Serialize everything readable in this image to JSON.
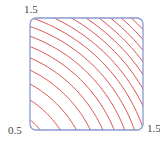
{
  "chart_data": {
    "type": "line",
    "subtype": "contour",
    "title": "",
    "xlabel": "",
    "ylabel": "",
    "xlim": [
      0.5,
      1.5
    ],
    "ylim": [
      0.5,
      1.5
    ],
    "function": "x^2 + y^2",
    "levels": [
      0.6,
      0.84,
      1.08,
      1.32,
      1.56,
      1.8,
      2.04,
      2.28,
      2.52,
      2.76,
      3.0,
      3.24,
      3.48,
      3.72,
      3.96,
      4.2,
      4.44
    ],
    "tick_labels": {
      "y_top": "1.5",
      "origin": "0.5",
      "x_right": "1.5"
    },
    "grid": false,
    "legend": null,
    "colors": {
      "contour": "#d9534f",
      "frame": "#8a9ad0"
    }
  }
}
